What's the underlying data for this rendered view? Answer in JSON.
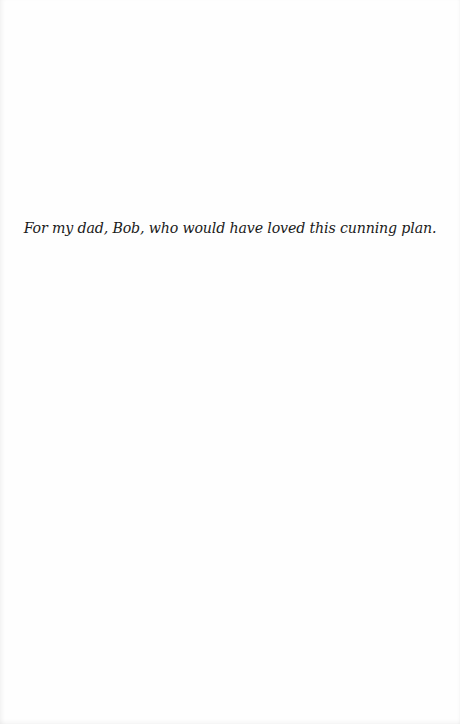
{
  "page": {
    "type": "dedication",
    "text": "For my dad, Bob, who would have loved this cunning plan.",
    "background_color": "#fefefe",
    "text_color": "#1a1a1a"
  }
}
